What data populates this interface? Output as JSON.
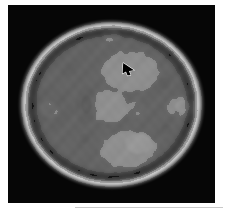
{
  "figure": {
    "kind": "axial-brain-mri-slice",
    "modality_label": "grayscale",
    "panel": {
      "background_color": "#000000",
      "x": 8,
      "y": 5,
      "width": 207,
      "height": 198
    },
    "page_background_color": "#ffffff",
    "caption_rule": {
      "color": "#c9c9c9",
      "x": 75,
      "y": 207,
      "width": 148,
      "height": 1
    }
  },
  "marker": {
    "name": "lesion-pointer-arrow",
    "color": "#000000",
    "outline_color": "#ffffff",
    "direction": "down-right",
    "x": 112,
    "y": 56,
    "target_description": "bright hyperintense focus, right frontal region"
  },
  "chart_data": {
    "type": "heatmap",
    "title": "",
    "xlabel": "",
    "ylabel": "",
    "colormap": "grayscale",
    "value_range": [
      0,
      255
    ],
    "grid": false,
    "legend": "none",
    "brain_outline": {
      "center_x": 103,
      "center_y": 99,
      "radius_x": 92,
      "radius_y": 84
    },
    "tissue_bands": [
      {
        "name": "background",
        "gray": 8
      },
      {
        "name": "outer-rim-bright",
        "gray": 210
      },
      {
        "name": "cortex-dark-band",
        "gray": 92
      },
      {
        "name": "white-matter-mid",
        "gray": 150
      },
      {
        "name": "deep-gray-dark",
        "gray": 70
      },
      {
        "name": "bright-focus",
        "gray": 238
      }
    ],
    "blobs": [
      {
        "cx": 103,
        "cy": 99,
        "rx": 92,
        "ry": 84,
        "gray": 150,
        "blur": 3
      },
      {
        "cx": 103,
        "cy": 99,
        "rx": 86,
        "ry": 78,
        "gray": 120,
        "blur": 4
      },
      {
        "cx": 103,
        "cy": 99,
        "rx": 78,
        "ry": 70,
        "gray": 168,
        "blur": 5
      },
      {
        "cx": 60,
        "cy": 46,
        "rx": 30,
        "ry": 20,
        "gray": 96,
        "blur": 7
      },
      {
        "cx": 118,
        "cy": 42,
        "rx": 34,
        "ry": 17,
        "gray": 108,
        "blur": 7
      },
      {
        "cx": 122,
        "cy": 66,
        "rx": 28,
        "ry": 20,
        "gray": 226,
        "blur": 5
      },
      {
        "cx": 60,
        "cy": 64,
        "rx": 16,
        "ry": 13,
        "gray": 104,
        "blur": 5
      },
      {
        "cx": 61,
        "cy": 64,
        "rx": 8,
        "ry": 7,
        "gray": 74,
        "blur": 3
      },
      {
        "cx": 42,
        "cy": 104,
        "rx": 22,
        "ry": 22,
        "gray": 84,
        "blur": 6
      },
      {
        "cx": 41,
        "cy": 104,
        "rx": 9,
        "ry": 8,
        "gray": 190,
        "blur": 3
      },
      {
        "cx": 78,
        "cy": 100,
        "rx": 11,
        "ry": 19,
        "gray": 72,
        "blur": 4
      },
      {
        "cx": 78,
        "cy": 99,
        "rx": 5,
        "ry": 9,
        "gray": 48,
        "blur": 2
      },
      {
        "cx": 101,
        "cy": 101,
        "rx": 17,
        "ry": 16,
        "gray": 228,
        "blur": 4
      },
      {
        "cx": 126,
        "cy": 104,
        "rx": 9,
        "ry": 8,
        "gray": 166,
        "blur": 4
      },
      {
        "cx": 156,
        "cy": 78,
        "rx": 14,
        "ry": 13,
        "gray": 96,
        "blur": 4
      },
      {
        "cx": 156,
        "cy": 78,
        "rx": 6,
        "ry": 6,
        "gray": 60,
        "blur": 2
      },
      {
        "cx": 158,
        "cy": 124,
        "rx": 13,
        "ry": 12,
        "gray": 94,
        "blur": 4
      },
      {
        "cx": 158,
        "cy": 124,
        "rx": 5,
        "ry": 5,
        "gray": 62,
        "blur": 2
      },
      {
        "cx": 172,
        "cy": 101,
        "rx": 14,
        "ry": 10,
        "gray": 186,
        "blur": 4
      },
      {
        "cx": 174,
        "cy": 101,
        "rx": 7,
        "ry": 6,
        "gray": 214,
        "blur": 2
      },
      {
        "cx": 76,
        "cy": 133,
        "rx": 13,
        "ry": 12,
        "gray": 96,
        "blur": 5
      },
      {
        "cx": 76,
        "cy": 133,
        "rx": 5,
        "ry": 5,
        "gray": 66,
        "blur": 2
      },
      {
        "cx": 120,
        "cy": 144,
        "rx": 28,
        "ry": 18,
        "gray": 224,
        "blur": 5
      },
      {
        "cx": 130,
        "cy": 138,
        "rx": 13,
        "ry": 10,
        "gray": 244,
        "blur": 3
      },
      {
        "cx": 62,
        "cy": 160,
        "rx": 26,
        "ry": 14,
        "gray": 104,
        "blur": 7
      },
      {
        "cx": 150,
        "cy": 158,
        "rx": 24,
        "ry": 14,
        "gray": 100,
        "blur": 7
      },
      {
        "cx": 103,
        "cy": 30,
        "rx": 9,
        "ry": 6,
        "gray": 206,
        "blur": 3
      },
      {
        "cx": 103,
        "cy": 120,
        "rx": 5,
        "ry": 4,
        "gray": 92,
        "blur": 2
      }
    ]
  }
}
